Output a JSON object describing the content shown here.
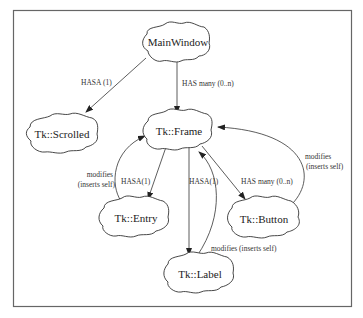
{
  "diagram": {
    "nodes": [
      {
        "id": "mainwindow",
        "label": "MainWindow"
      },
      {
        "id": "scrolled",
        "label": "Tk::Scrolled"
      },
      {
        "id": "frame",
        "label": "Tk::Frame"
      },
      {
        "id": "entry",
        "label": "Tk::Entry"
      },
      {
        "id": "button",
        "label": "Tk::Button"
      },
      {
        "id": "label",
        "label": "Tk::Label"
      }
    ],
    "edges": [
      {
        "from": "mainwindow",
        "to": "scrolled",
        "label": "HASA (1)"
      },
      {
        "from": "mainwindow",
        "to": "frame",
        "label": "HAS many (0..n)"
      },
      {
        "from": "frame",
        "to": "entry",
        "label": "HASA(1)"
      },
      {
        "from": "entry",
        "to": "frame",
        "label_line1": "modifies",
        "label_line2": "(inserts self)"
      },
      {
        "from": "frame",
        "to": "label",
        "label": "HASA(1)"
      },
      {
        "from": "label",
        "to": "frame",
        "label": "modifies (inserts self)"
      },
      {
        "from": "frame",
        "to": "button",
        "label": "HAS many (0..n)"
      },
      {
        "from": "button",
        "to": "frame",
        "label_line1": "modifies",
        "label_line2": "(inserts self)"
      }
    ]
  }
}
